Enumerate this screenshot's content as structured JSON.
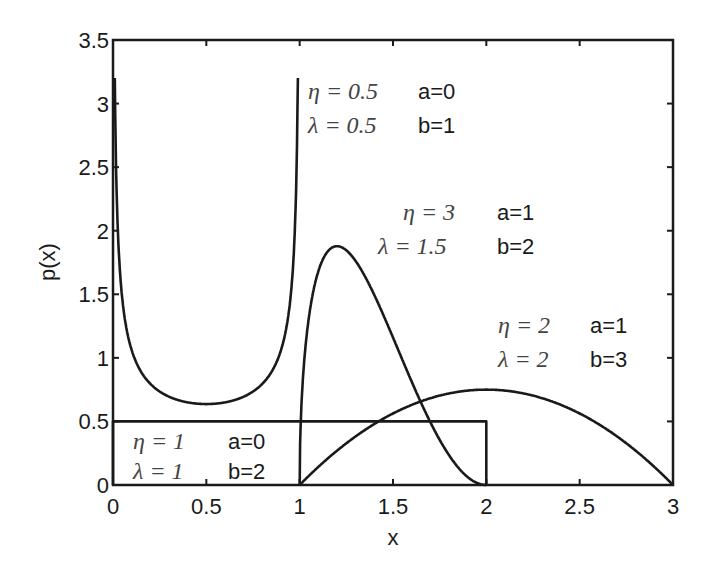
{
  "chart_data": {
    "type": "line",
    "title": "",
    "xlabel": "x",
    "ylabel": "p(x)",
    "xlim": [
      0,
      3
    ],
    "ylim": [
      0,
      3.5
    ],
    "grid": false,
    "legend": "none (inline annotations)",
    "xticks": [
      "0",
      "0.5",
      "1",
      "1.5",
      "2",
      "2.5",
      "3"
    ],
    "yticks": [
      "0",
      "0.5",
      "1",
      "1.5",
      "2",
      "2.5",
      "3",
      "3.5"
    ],
    "series": [
      {
        "name": "eta=0.5 lambda=0.5 a=0 b=1",
        "eta": 0.5,
        "lambda": 0.5,
        "a": 0,
        "b": 1,
        "x": [
          0.01,
          0.02,
          0.05,
          0.1,
          0.2,
          0.3,
          0.4,
          0.5,
          0.6,
          0.7,
          0.8,
          0.9,
          0.95,
          0.98,
          0.99
        ],
        "y": [
          3.2,
          2.27,
          1.46,
          1.06,
          0.8,
          0.695,
          0.65,
          0.637,
          0.65,
          0.695,
          0.8,
          1.06,
          1.46,
          2.27,
          3.2
        ]
      },
      {
        "name": "eta=3 lambda=1.5 a=1 b=2",
        "eta": 3,
        "lambda": 1.5,
        "a": 1,
        "b": 2,
        "x": [
          1.0,
          1.05,
          1.1,
          1.15,
          1.2,
          1.3,
          1.4,
          1.5,
          1.6,
          1.7,
          1.8,
          1.9,
          2.0
        ],
        "y": [
          0,
          1.32,
          1.68,
          1.84,
          1.88,
          1.76,
          1.49,
          1.16,
          0.81,
          0.49,
          0.24,
          0.06,
          0
        ]
      },
      {
        "name": "eta=2 lambda=2 a=1 b=3",
        "eta": 2,
        "lambda": 2,
        "a": 1,
        "b": 3,
        "x": [
          1.0,
          1.25,
          1.5,
          1.75,
          2.0,
          2.25,
          2.5,
          2.75,
          3.0
        ],
        "y": [
          0,
          0.328,
          0.5625,
          0.703,
          0.75,
          0.703,
          0.5625,
          0.328,
          0
        ]
      },
      {
        "name": "eta=1 lambda=1 a=0 b=2",
        "eta": 1,
        "lambda": 1,
        "a": 0,
        "b": 2,
        "x": [
          0,
          0,
          2,
          2
        ],
        "y": [
          0,
          0.5,
          0.5,
          0
        ]
      }
    ],
    "annotations": [
      {
        "eta": "η = 0.5",
        "lambda": "λ = 0.5",
        "a": "a=0",
        "b": "b=1"
      },
      {
        "eta": "η = 3",
        "lambda": "λ = 1.5",
        "a": "a=1",
        "b": "b=2"
      },
      {
        "eta": "η = 2",
        "lambda": "λ = 2",
        "a": "a=1",
        "b": "b=3"
      },
      {
        "eta": "η = 1",
        "lambda": "λ = 1",
        "a": "a=0",
        "b": "b=2"
      }
    ]
  }
}
